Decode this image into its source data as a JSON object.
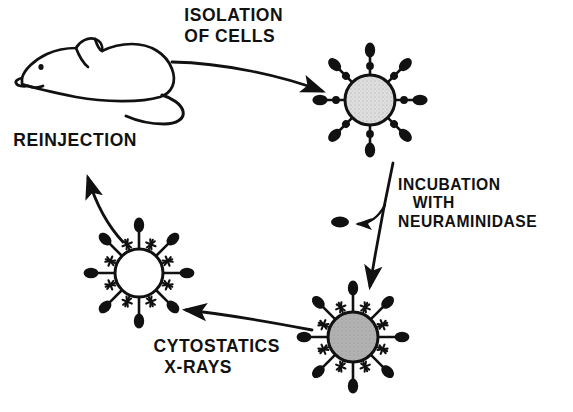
{
  "figure": {
    "background_color": "#ffffff",
    "ink_color": "#111111",
    "width": 573,
    "height": 412
  },
  "labels": {
    "isolation": "ISOLATION\nOF CELLS",
    "reinjection": "REINJECTION",
    "incubation": "INCUBATION\n   WITH\nNEURAMINIDASE",
    "cytostatics": "CYTOSTATICS\n  X-RAYS"
  },
  "elements": {
    "mouse": "mouse-illustration",
    "cell_isolated": "cell-with-sialic-acid",
    "cell_desialylated": "cell-with-stars",
    "cell_inactivated": "inactivated-cell",
    "enzyme_product": "cleaved-sialic-acid-blob"
  },
  "cells": [
    {
      "id": "cell-isolated",
      "name": "isolated-tumor-cell",
      "cx": 370,
      "cy": 100,
      "r": 25,
      "fill": "#d8d8d8",
      "fill_label": "light-gray-stippled",
      "spikes": 8,
      "spike_len": 22,
      "has_dots": true,
      "has_stars": false,
      "stars": 0
    },
    {
      "id": "cell-desialylated",
      "name": "neuraminidase-treated-cell",
      "cx": 353,
      "cy": 337,
      "r": 25,
      "fill": "#a9a9a9",
      "fill_label": "medium-gray",
      "spikes": 8,
      "spike_len": 22,
      "has_dots": false,
      "has_stars": true,
      "stars": 8
    },
    {
      "id": "cell-inactivated",
      "name": "inactivated-cell",
      "cx": 139,
      "cy": 273,
      "r": 24,
      "fill": "#ffffff",
      "fill_label": "white-unfilled",
      "spikes": 8,
      "spike_len": 22,
      "has_dots": false,
      "has_stars": true,
      "stars": 8
    }
  ],
  "arrows": [
    {
      "id": "arrow-isolation",
      "name": "isolation-arrow",
      "from": "mouse",
      "to": "cell-isolated",
      "direction": "right"
    },
    {
      "id": "arrow-incubation",
      "name": "incubation-arrow",
      "from": "cell-isolated",
      "to": "cell-desialylated",
      "direction": "down"
    },
    {
      "id": "arrow-enzyme",
      "name": "cleavage-arrow",
      "from": "incubation-arrow",
      "to": "enzyme-product",
      "direction": "left"
    },
    {
      "id": "arrow-cytostatics",
      "name": "cytostatics-arrow",
      "from": "cell-desialylated",
      "to": "cell-inactivated",
      "direction": "left"
    },
    {
      "id": "arrow-reinjection",
      "name": "reinjection-arrow",
      "from": "cell-inactivated",
      "to": "mouse",
      "direction": "up-left"
    }
  ]
}
